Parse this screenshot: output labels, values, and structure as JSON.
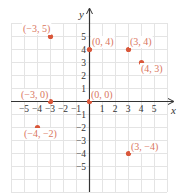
{
  "chart_data": {
    "type": "scatter",
    "title": "",
    "xlabel": "x",
    "ylabel": "y",
    "xlim": [
      -6,
      6
    ],
    "ylim": [
      -7,
      6
    ],
    "x_ticks": [
      -5,
      -4,
      -3,
      -2,
      -1,
      1,
      2,
      3,
      4,
      5
    ],
    "y_ticks": [
      -5,
      -4,
      -3,
      -2,
      -1,
      1,
      2,
      3,
      4,
      5
    ],
    "grid": true,
    "points": [
      {
        "x": -3,
        "y": 5,
        "label": "(−3, 5)"
      },
      {
        "x": 0,
        "y": 4,
        "label": "(0, 4)"
      },
      {
        "x": 3,
        "y": 4,
        "label": "(3, 4)"
      },
      {
        "x": 4,
        "y": 3,
        "label": "(4, 3)"
      },
      {
        "x": -3,
        "y": 0,
        "label": "(−3, 0)"
      },
      {
        "x": 0,
        "y": 0,
        "label": "(0, 0)"
      },
      {
        "x": -4,
        "y": -2,
        "label": "(−4, −2)"
      },
      {
        "x": 3,
        "y": -4,
        "label": "(3, −4)"
      }
    ]
  },
  "colors": {
    "point": "#d9573a",
    "label": "#d9765e",
    "grid": "#e4e4e4",
    "axis": "#333333"
  },
  "axis_labels": {
    "x": "x",
    "y": "y"
  }
}
